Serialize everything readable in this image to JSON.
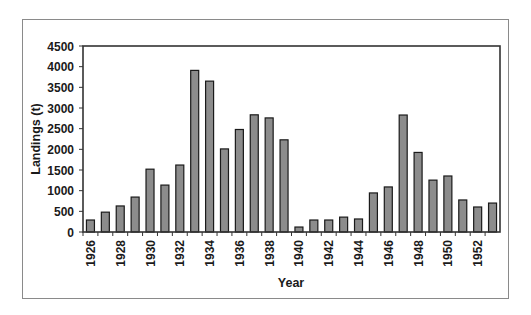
{
  "chart_data": {
    "type": "bar",
    "title": "",
    "xlabel": "Year",
    "ylabel": "Landings (t)",
    "ylim": [
      0,
      4500
    ],
    "yticks": [
      0,
      500,
      1000,
      1500,
      2000,
      2500,
      3000,
      3500,
      4000,
      4500
    ],
    "categories": [
      "1926",
      "1927",
      "1928",
      "1929",
      "1930",
      "1931",
      "1932",
      "1933",
      "1934",
      "1935",
      "1936",
      "1937",
      "1938",
      "1939",
      "1940",
      "1941",
      "1942",
      "1943",
      "1944",
      "1945",
      "1946",
      "1947",
      "1948",
      "1949",
      "1950",
      "1951",
      "1952",
      "1953"
    ],
    "xtick_labels_shown": [
      "1926",
      "1928",
      "1930",
      "1932",
      "1934",
      "1936",
      "1938",
      "1940",
      "1942",
      "1944",
      "1946",
      "1948",
      "1950",
      "1952"
    ],
    "values": [
      290,
      480,
      630,
      845,
      1520,
      1135,
      1620,
      3910,
      3650,
      2010,
      2480,
      2835,
      2760,
      2230,
      120,
      290,
      290,
      360,
      315,
      945,
      1090,
      2830,
      1925,
      1255,
      1355,
      775,
      605,
      700
    ],
    "grid": false,
    "legend": null,
    "colors": {
      "bar_fill": "#8c8c8c",
      "bar_stroke": "#1a1a1a",
      "axis": "#333333",
      "frame": "#8a8a8a"
    }
  }
}
